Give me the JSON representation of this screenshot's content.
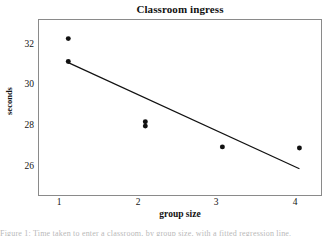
{
  "figure": {
    "title": "Classroom ingress",
    "caption_partial": "Figure 1: Time taken to enter a classroom, by group size, with a fitted regression line."
  },
  "axes": {
    "x_title": "group size",
    "y_title": "seconds",
    "x_ticks": [
      "1",
      "2",
      "3",
      "4"
    ],
    "y_ticks": [
      "26",
      "28",
      "30",
      "32"
    ]
  },
  "colors": {
    "frame": "#8a8a8a",
    "marker": "#111111",
    "line": "#111111",
    "background": "#ffffff",
    "text": "#141414"
  },
  "chart_data": {
    "type": "scatter",
    "title": "Classroom ingress",
    "xlabel": "group size",
    "ylabel": "seconds",
    "xlim": [
      0.62,
      4.28
    ],
    "ylim": [
      25.0,
      33.0
    ],
    "grid": false,
    "legend": "none",
    "x_ticks": [
      1,
      2,
      3,
      4
    ],
    "y_ticks": [
      26,
      28,
      30,
      32
    ],
    "points": [
      {
        "x": 1,
        "y": 32.15
      },
      {
        "x": 1,
        "y": 31.1
      },
      {
        "x": 2,
        "y": 28.35
      },
      {
        "x": 2,
        "y": 28.15
      },
      {
        "x": 3,
        "y": 27.2
      },
      {
        "x": 4,
        "y": 27.15
      }
    ],
    "series": [
      {
        "name": "observations",
        "x": [
          1,
          1,
          2,
          2,
          3,
          3,
          4
        ],
        "values": [
          32.15,
          31.1,
          28.35,
          28.15,
          27.2,
          27.2,
          27.15
        ]
      }
    ],
    "fit_line": {
      "name": "regression line",
      "x": [
        1,
        4
      ],
      "values": [
        31.05,
        26.2
      ],
      "slope": -1.617,
      "intercept": 32.667
    }
  }
}
